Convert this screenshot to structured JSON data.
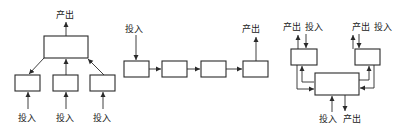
{
  "diagram": {
    "labels": {
      "input": "投入",
      "output": "产出"
    },
    "panels": [
      {
        "id": "hierarchical",
        "top_output": "产出",
        "bottom_inputs": [
          "投入",
          "投入",
          "投入"
        ]
      },
      {
        "id": "sequential",
        "input": "投入",
        "output": "产出",
        "box_count": 4
      },
      {
        "id": "reciprocal",
        "left_labels": [
          "产出",
          "投入"
        ],
        "right_labels": [
          "产出",
          "投入"
        ],
        "bottom_labels": [
          "投入",
          "产出"
        ]
      }
    ],
    "colors": {
      "stroke": "#2a2a2a",
      "text": "#222222",
      "background": "#ffffff"
    }
  }
}
